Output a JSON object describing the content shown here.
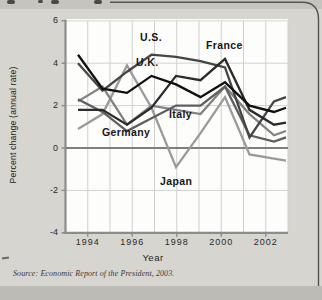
{
  "figure": {
    "background_color": "#d7d5d0",
    "border_color": "#55544e"
  },
  "chart": {
    "y_axis": {
      "title": "Percent change (annual rate)",
      "tick_labels": [
        "6",
        "4",
        "2",
        "0",
        "-2",
        "-4"
      ],
      "tick_values": [
        6,
        4,
        2,
        0,
        -2,
        -4
      ]
    },
    "x_axis": {
      "title": "Year",
      "tick_labels": [
        "1994",
        "1996",
        "1998",
        "2000",
        "2002"
      ],
      "tick_values": [
        1994,
        1996,
        1998,
        2000,
        2002
      ]
    },
    "source": "Source: Economic Report of the President, 2003."
  },
  "chart_data": {
    "type": "line",
    "title": "",
    "xlabel": "Year",
    "ylabel": "Percent change (annual rate)",
    "x": [
      1994,
      1995,
      1996,
      1997,
      1998,
      1999,
      2000,
      2001,
      2002
    ],
    "xlim": [
      1993,
      2003
    ],
    "ylim": [
      -4,
      6
    ],
    "grid": true,
    "legend_position": "labels-on-lines",
    "series": [
      {
        "name": "Japan",
        "label": "Japan",
        "color": "#9a9a9a",
        "values": [
          0.9,
          1.6,
          3.9,
          1.9,
          -0.9,
          0.7,
          2.4,
          -0.3,
          -0.5
        ],
        "end_value": -0.6,
        "label_pos": [
          160,
          175
        ]
      },
      {
        "name": "Italy",
        "label": "Italy",
        "color": "#828282",
        "values": [
          2.2,
          2.9,
          1.1,
          2.0,
          1.8,
          1.6,
          2.9,
          1.6,
          0.6
        ],
        "end_value": 0.8,
        "label_pos": [
          169,
          108
        ]
      },
      {
        "name": "Germany",
        "label": "Germany",
        "color": "#5f5f5f",
        "values": [
          2.3,
          1.7,
          0.8,
          1.4,
          2.0,
          2.0,
          2.9,
          0.6,
          0.3
        ],
        "end_value": 0.5,
        "label_pos": [
          102,
          126
        ]
      },
      {
        "name": "U.S.",
        "label": "U.S.",
        "color": "#454545",
        "values": [
          4.0,
          2.7,
          3.6,
          4.4,
          4.3,
          4.1,
          3.8,
          0.5,
          2.2
        ],
        "end_value": 2.4,
        "label_pos": [
          140,
          31
        ]
      },
      {
        "name": "France",
        "label": "France",
        "color": "#2b2b2b",
        "values": [
          1.8,
          1.8,
          1.1,
          1.9,
          3.4,
          3.2,
          4.2,
          1.8,
          1.1
        ],
        "end_value": 1.2,
        "label_pos": [
          206,
          39
        ]
      },
      {
        "name": "U.K.",
        "label": "U.K.",
        "color": "#101010",
        "values": [
          4.4,
          2.8,
          2.6,
          3.4,
          3.0,
          2.4,
          3.1,
          2.0,
          1.7
        ],
        "end_value": 1.9,
        "label_pos": [
          136,
          56
        ]
      }
    ],
    "source": "Economic Report of the President, 2003"
  }
}
